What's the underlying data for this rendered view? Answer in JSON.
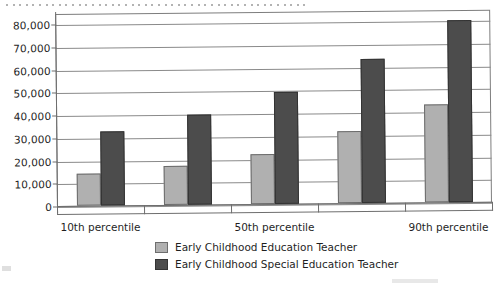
{
  "chart_data": {
    "type": "bar",
    "title": "",
    "xlabel": "",
    "ylabel": "",
    "ylim": [
      0,
      85000
    ],
    "ytick_values": [
      0,
      10000,
      20000,
      30000,
      40000,
      50000,
      60000,
      70000,
      80000
    ],
    "ytick_labels": [
      "0",
      "10,000",
      "20,000",
      "30,000",
      "40,000",
      "50,000",
      "60,000",
      "70,000",
      "80,000"
    ],
    "grid": true,
    "legend_position": "bottom",
    "categories": [
      "10th percentile",
      "25th percentile",
      "50th percentile",
      "75th percentile",
      "90th percentile"
    ],
    "visible_category_labels": [
      "10th percentile",
      "50th percentile",
      "90th percentile"
    ],
    "visible_category_indices": [
      0,
      2,
      4
    ],
    "series": [
      {
        "name": "Early Childhood Education Teacher",
        "color": "#b0b0b0",
        "values": [
          14000,
          17000,
          22000,
          31500,
          43000
        ]
      },
      {
        "name": "Early Childhood Special Education Teacher",
        "color": "#4c4c4c",
        "values": [
          32500,
          39500,
          49500,
          63500,
          80000
        ]
      }
    ]
  },
  "legend": {
    "items": [
      {
        "label": "Early Childhood Education Teacher",
        "color": "#b0b0b0"
      },
      {
        "label": "Early Childhood Special Education Teacher",
        "color": "#4c4c4c"
      }
    ]
  },
  "colors": {
    "series_light": "#b0b0b0",
    "series_dark": "#4c4c4c",
    "axis": "#6e6e6e",
    "grid": "#8a8a8a",
    "text": "#1f1f1f",
    "background": "#ffffff"
  }
}
